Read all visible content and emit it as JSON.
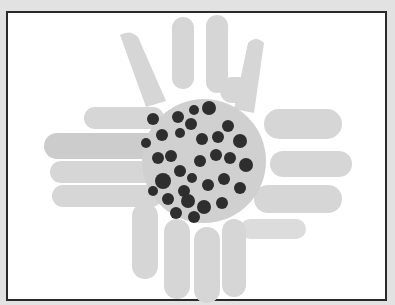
{
  "image": {
    "subject": "handprint sunflower artwork",
    "colors": {
      "background": "#e2e2e2",
      "frame_border": "#2a2a2a",
      "canvas": "#ffffff",
      "petal": "#d4d4d4",
      "petal_shadow": "#bdbdbd",
      "center": "#cfcfcf",
      "seed": "#2e2e2e"
    }
  }
}
